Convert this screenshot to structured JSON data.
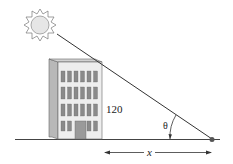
{
  "diagram": {
    "type": "trigonometry-word-problem",
    "labels": {
      "height": "120",
      "angle": "θ",
      "distance": "x"
    },
    "elements": {
      "sun": "sun-icon",
      "building": "office-building",
      "ground": "ground-line",
      "sight_line": "line from sun past building top to point on ground",
      "observer_point": "dot on ground",
      "distance_arrow": "double-headed arrow from building base to observer point"
    },
    "colors": {
      "line": "#333333",
      "building_front": "#eeeeee",
      "building_side": "#b8b8b8",
      "building_roof": "#cfcfcf",
      "window": "#8a8a8a",
      "door": "#9a9a9a",
      "sun_fill": "#e6e6e6",
      "dot": "#555555"
    }
  }
}
